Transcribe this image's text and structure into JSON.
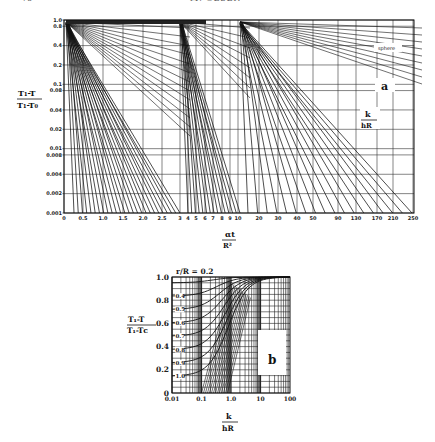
{
  "page": {
    "page_number": "76",
    "running_head": "M. OLSEN"
  },
  "chart_data": [
    {
      "id": "a",
      "type": "line",
      "panel_label": "a",
      "annotation": "sphere",
      "title": "",
      "ylabel": "(T1-T)/(T1-T0)",
      "ylabel_num": "T₁-T",
      "ylabel_den": "T₁-T₀",
      "xlabel": "αt/R²",
      "xlabel_num": "αt",
      "xlabel_den": "R²",
      "param_label": "k/hR",
      "param_num": "k",
      "param_den": "hR",
      "yscale": "log",
      "ylim": [
        0.001,
        1.0
      ],
      "y_ticks": [
        "1.0",
        "0.8",
        "0.4",
        "0.2",
        "0.1",
        "0.08",
        "0.04",
        "0.02",
        "0.01",
        "0.008",
        "0.004",
        "0.002",
        "0.001"
      ],
      "x_ticks": [
        "0",
        "0.5",
        "1.0",
        "1.5",
        "2.0",
        "2.5",
        "3",
        "4",
        "5",
        "6",
        "7",
        "8",
        "9",
        "10",
        "20",
        "30",
        "40",
        "50",
        "90",
        "130",
        "170",
        "210",
        "250"
      ],
      "grid": true,
      "description": "Heisler-type chart for the center temperature of a sphere; three families of straight lines on semi-log axes with parameter k/hR",
      "segments": [
        {
          "x_range": [
            0,
            3
          ],
          "k_over_hR": [
            0,
            0.05,
            0.1,
            0.15,
            0.2,
            0.25,
            0.3,
            0.35,
            0.4,
            0.5,
            0.6,
            0.75,
            1.0,
            1.2,
            1.4,
            1.75,
            2.0,
            2.5,
            3.0,
            3.5
          ]
        },
        {
          "x_range": [
            3,
            10
          ],
          "k_over_hR": [
            4,
            5,
            6,
            7,
            8,
            9,
            10,
            12,
            14
          ]
        },
        {
          "x_range": [
            10,
            250
          ],
          "k_over_hR": [
            18,
            20,
            25,
            30,
            35,
            40,
            50,
            60,
            70,
            80,
            90,
            100
          ]
        }
      ]
    },
    {
      "id": "b",
      "type": "line",
      "panel_label": "b",
      "title": "",
      "ylabel": "(T1-T)/(T1-Tc)",
      "ylabel_num": "T₁-T",
      "ylabel_den": "T₁-Tᴄ",
      "xlabel": "k/hR",
      "xlabel_num": "k",
      "xlabel_den": "hR",
      "xscale": "log",
      "xlim": [
        0.01,
        100
      ],
      "ylim": [
        0,
        1.0
      ],
      "y_ticks": [
        "1.0",
        "0.8",
        "0.6",
        "0.4",
        "0.2",
        "0"
      ],
      "x_ticks": [
        "0.01",
        "0.1",
        "1.0",
        "10",
        "100"
      ],
      "grid": true,
      "series_label_prefix": "r/R = ",
      "series": [
        {
          "name": "0.2",
          "label": "r/R = 0.2"
        },
        {
          "name": "0.4",
          "label": "0.4"
        },
        {
          "name": "0.5",
          "label": "0.5"
        },
        {
          "name": "0.6",
          "label": "0.6"
        },
        {
          "name": "0.7",
          "label": "0.7"
        },
        {
          "name": "0.8",
          "label": "0.8"
        },
        {
          "name": "0.9",
          "label": "0.9"
        },
        {
          "name": "1.0",
          "label": "1.0"
        }
      ],
      "description": "Position correction chart: curves rise from low values at small k/hR toward 1.0 at large k/hR"
    }
  ]
}
